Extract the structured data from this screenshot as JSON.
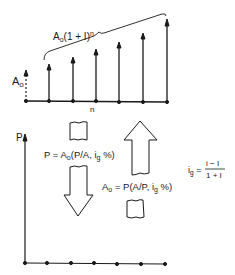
{
  "top_diagram": {
    "brace_label": "A₀(1 + I)ⁿ",
    "base_label": "A₀",
    "period_label": "n",
    "arrow_x": [
      26,
      49,
      73,
      96,
      119,
      143,
      167
    ],
    "arrow_tip_y": [
      74,
      66,
      58,
      51,
      44,
      35,
      21
    ]
  },
  "bottom_diagram": {
    "axis_label": "P",
    "dot_x": [
      26,
      49,
      73,
      96,
      119,
      143,
      167
    ]
  },
  "formulas": {
    "present_worth": "P = A₀(P/A, iᵧ %)",
    "present_worth_main": "P = A",
    "annuity": "A₀ = P(A/P, i g %)",
    "growth_rate_lhs": "i",
    "growth_rate_sub": "g",
    "growth_rate_eq": "=",
    "growth_rate_num": "i − I",
    "growth_rate_den": "1 + I"
  },
  "colors": {
    "ink": "#1a1a1a",
    "background": "#ffffff"
  }
}
